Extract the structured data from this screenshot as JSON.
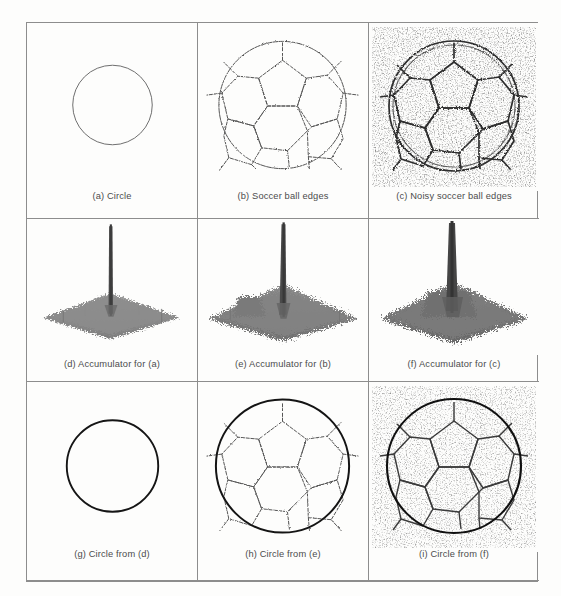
{
  "figure": {
    "kind": "nine-panel-image-grid",
    "background_color": "#fdfdfc",
    "border_color": "#8d8d8d",
    "columns": 3,
    "rows": 3
  },
  "panels": [
    {
      "id": "a",
      "caption": "(a) Circle",
      "content": "thin-outline-circle",
      "stroke_color": "#6a6a6a",
      "stroke_width": 1,
      "circle": {
        "cx": 86,
        "cy": 82,
        "r": 40
      }
    },
    {
      "id": "b",
      "caption": "(b) Soccer ball edges",
      "content": "soccer-ball-edge-map",
      "stroke_color": "#5a5a5a",
      "stroke_width": 1,
      "circle": {
        "cx": 85,
        "cy": 82,
        "r": 65
      }
    },
    {
      "id": "c",
      "caption": "(c) Noisy soccer ball edges",
      "content": "noisy-soccer-ball-edge-map",
      "stroke_color": "#3a3a3a",
      "stroke_width": 1.6,
      "noise": "salt-and-pepper",
      "circle": {
        "cx": 85,
        "cy": 82,
        "r": 66
      }
    },
    {
      "id": "d",
      "caption": "(d) Accumulator for (a)",
      "content": "accumulator-surface-plot",
      "peak_label": "single sharp spike",
      "surface_color": "#8a8a8a",
      "floor_noise": "low"
    },
    {
      "id": "e",
      "caption": "(e) Accumulator for (b)",
      "content": "accumulator-surface-plot",
      "peak_label": "single sharp spike",
      "surface_color": "#7d7d7d",
      "floor_noise": "medium"
    },
    {
      "id": "f",
      "caption": "(f) Accumulator for (c)",
      "content": "accumulator-surface-plot",
      "peak_label": "single sharp spike",
      "surface_color": "#707070",
      "floor_noise": "high"
    },
    {
      "id": "g",
      "caption": "(g) Circle from (d)",
      "content": "detected-circle-overlay",
      "stroke_color": "#141414",
      "stroke_width": 2,
      "circle": {
        "cx": 86,
        "cy": 84,
        "r": 46
      }
    },
    {
      "id": "h",
      "caption": "(h) Circle from (e)",
      "content": "detected-circle-over-soccer-ball",
      "stroke_color": "#141414",
      "stroke_width": 2,
      "circle": {
        "cx": 85,
        "cy": 84,
        "r": 68
      }
    },
    {
      "id": "i",
      "caption": "(i) Circle from (f)",
      "content": "detected-circle-over-noisy-soccer-ball",
      "stroke_color": "#141414",
      "stroke_width": 2,
      "noise": "salt-and-pepper",
      "circle": {
        "cx": 85,
        "cy": 84,
        "r": 68
      }
    }
  ]
}
